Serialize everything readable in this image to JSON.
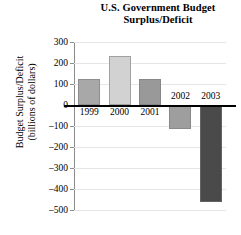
{
  "chart_data": {
    "type": "bar",
    "title": "U.S. Government Budget Surplus/Deficit",
    "title_lines": [
      "U.S. Government Budget",
      "Surplus/Deficit"
    ],
    "xlabel": "",
    "ylabel": "Budget Surplus/Deficit (billions of dollars)",
    "ylabel_lines": [
      "Budget Surplus/Deficit",
      "(billions of dollars)"
    ],
    "categories": [
      "1999",
      "2000",
      "2001",
      "2002",
      "2003"
    ],
    "values": [
      125,
      235,
      125,
      -115,
      -460
    ],
    "ylim": [
      -500,
      300
    ],
    "ytick_labels": [
      "300",
      "200",
      "100",
      "0",
      "–100",
      "–200",
      "–300",
      "–400",
      "–500"
    ],
    "ytick_values": [
      300,
      200,
      100,
      0,
      -100,
      -200,
      -300,
      -400,
      -500
    ],
    "grid": true,
    "legend": "none",
    "bar_colors": [
      "#a8a8a8",
      "#d2d2d2",
      "#999999",
      "#9e9e9e",
      "#4a4a4a"
    ],
    "zero_line_color": "#000000",
    "axis_color": "#8c8c8c",
    "gridline_color": "#e6e6e6"
  }
}
